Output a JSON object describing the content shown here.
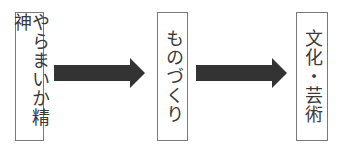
{
  "diagram": {
    "type": "flow",
    "direction": "left-to-right",
    "nodes": [
      {
        "id": "node1",
        "label": "やらまいか精神"
      },
      {
        "id": "node2",
        "label": "ものづくり"
      },
      {
        "id": "node3",
        "label": "文化・芸術"
      }
    ],
    "edges": [
      {
        "from": "node1",
        "to": "node2",
        "icon": "right-arrow-icon"
      },
      {
        "from": "node2",
        "to": "node3",
        "icon": "right-arrow-icon"
      }
    ],
    "colors": {
      "arrow": "#333333",
      "border": "#7a7a7a",
      "text": "#3a3a3a"
    }
  }
}
